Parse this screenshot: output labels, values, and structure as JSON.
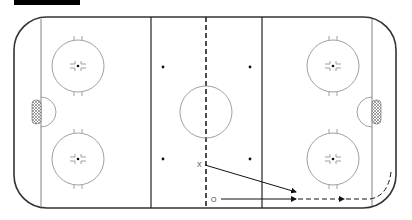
{
  "diagram": {
    "type": "hockey-rink-play",
    "header_bar": {
      "color": "#000000"
    },
    "rink": {
      "board_color": "#333333",
      "line_color": "#555555",
      "circle_color": "#888888"
    },
    "players": [
      {
        "symbol": "X",
        "label": "X",
        "x": 199,
        "y": 164
      },
      {
        "symbol": "O",
        "label": "O",
        "x": 214,
        "y": 200
      }
    ],
    "paths": [
      {
        "from": "X",
        "style": "solid",
        "type": "pass"
      },
      {
        "from": "O",
        "style": "solid",
        "type": "skate"
      },
      {
        "from": "O",
        "style": "dashed",
        "type": "skate-curve"
      }
    ]
  }
}
